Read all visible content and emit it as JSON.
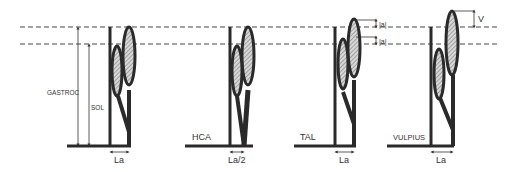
{
  "diagram": {
    "reference_lines": {
      "upper_y": 27,
      "lower_y": 44
    },
    "colors": {
      "ink": "#2a2a2a",
      "hatch": "#9a9a9a",
      "background": "#ffffff"
    },
    "panels": [
      {
        "id": "normal",
        "labels": {
          "gastroc": "GASTROC",
          "sol": "SOL",
          "lever": "La"
        }
      },
      {
        "id": "hca",
        "labels": {
          "name": "HCA",
          "lever": "La/2"
        }
      },
      {
        "id": "tal",
        "labels": {
          "name": "TAL",
          "delta_top": "|a|",
          "delta_bottom": "|a|",
          "lever": "La"
        }
      },
      {
        "id": "vulpius",
        "labels": {
          "name": "VULPIUS",
          "v": "V",
          "lever": "La"
        }
      }
    ]
  }
}
